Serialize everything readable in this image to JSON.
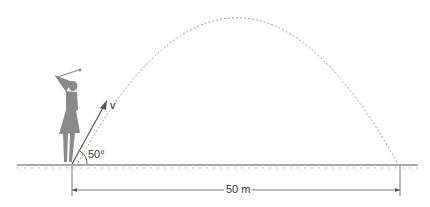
{
  "diagram": {
    "title": "",
    "labels": {
      "velocity": "v",
      "angle": "50°",
      "distance": "50 m"
    },
    "colors": {
      "golfer": "#8a8a8a",
      "trajectory": "#9a9a9a",
      "ground": "#555555",
      "arrow": "#555555",
      "text": "#333333"
    }
  }
}
